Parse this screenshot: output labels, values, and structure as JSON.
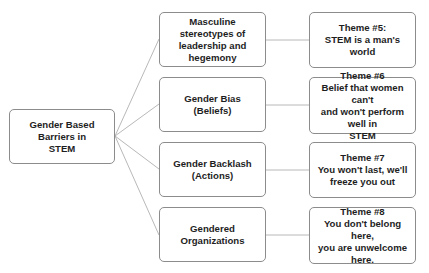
{
  "diagram": {
    "type": "tree",
    "root": {
      "label": "Gender Based Barriers in\nSTEM"
    },
    "barriers": [
      {
        "label": "Masculine stereotypes of\nleadership and hegemony"
      },
      {
        "label": "Gender Bias\n(Beliefs)"
      },
      {
        "label": "Gender Backlash\n(Actions)"
      },
      {
        "label": "Gendered Organizations"
      }
    ],
    "themes": [
      {
        "label": "Theme #5:\nSTEM is a man's world"
      },
      {
        "label": "Theme #6\nBelief that women can't\nand won't perform well in\nSTEM"
      },
      {
        "label": "Theme #7\nYou won't last, we'll\nfreeze you out"
      },
      {
        "label": "Theme #8\nYou don't belong here,\nyou are unwelcome here."
      }
    ],
    "colors": {
      "border": "#8c8c8c",
      "connector": "#a6a6a6",
      "text": "#1e1e1e"
    }
  }
}
